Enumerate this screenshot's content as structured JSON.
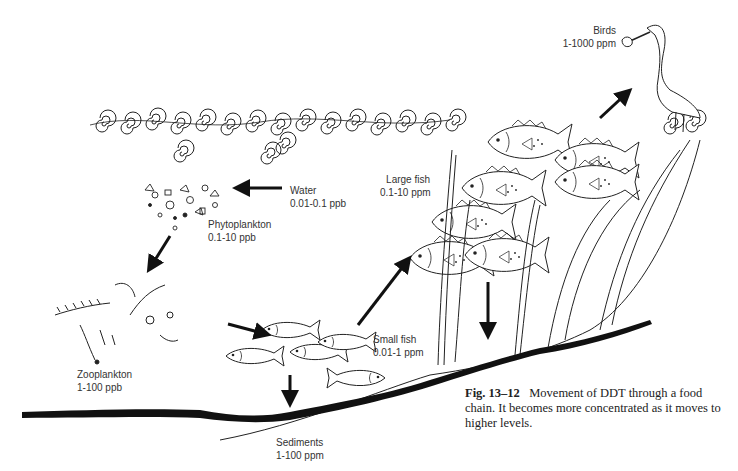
{
  "header": {
    "running_text": "",
    "page_number": ""
  },
  "figure": {
    "number": "Fig. 13–12",
    "caption": "Movement of DDT through a food chain. It becomes more concentrated as it moves to higher levels."
  },
  "nodes": [
    {
      "id": "water",
      "name": "Water",
      "concentration": "0.01-0.1 ppb"
    },
    {
      "id": "phytoplankton",
      "name": "Phytoplankton",
      "concentration": "0.1-10 ppb"
    },
    {
      "id": "zooplankton",
      "name": "Zooplankton",
      "concentration": "1-100 ppb"
    },
    {
      "id": "small_fish",
      "name": "Small fish",
      "concentration": "0.01-1 ppm"
    },
    {
      "id": "large_fish",
      "name": "Large fish",
      "concentration": "0.1-10 ppm"
    },
    {
      "id": "birds",
      "name": "Birds",
      "concentration": "1-1000 ppm"
    },
    {
      "id": "sediments",
      "name": "Sediments",
      "concentration": "1-100 ppm"
    }
  ],
  "flows": [
    {
      "from": "water",
      "to": "phytoplankton"
    },
    {
      "from": "phytoplankton",
      "to": "zooplankton"
    },
    {
      "from": "zooplankton",
      "to": "small_fish"
    },
    {
      "from": "small_fish",
      "to": "large_fish"
    },
    {
      "from": "large_fish",
      "to": "birds"
    },
    {
      "from": "small_fish",
      "to": "sediments"
    },
    {
      "from": "large_fish",
      "to": "sediments"
    }
  ]
}
